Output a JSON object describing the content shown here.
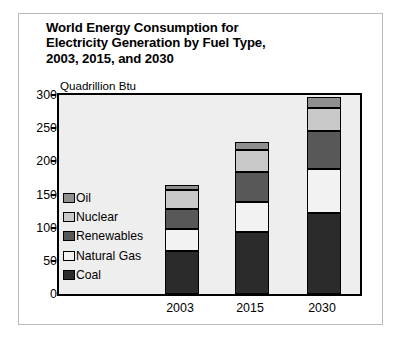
{
  "chart_data": {
    "type": "bar",
    "subtype": "stacked-column",
    "title": "World Energy Consumption for Electricity Generation by Fuel Type, 2003, 2015, and 2030",
    "title_lines": [
      "World Energy Consumption for",
      "Electricity Generation by Fuel Type,",
      "2003, 2015, and 2030"
    ],
    "xlabel": "",
    "ylabel": "Quadrillion Btu",
    "unit_label": "Quadrillion Btu",
    "categories": [
      "2003",
      "2015",
      "2030"
    ],
    "ylim": [
      0,
      300
    ],
    "yticks": [
      0,
      50,
      100,
      150,
      200,
      250,
      300
    ],
    "ytick_labels": [
      "0",
      "50",
      "100",
      "150",
      "200",
      "250",
      "300"
    ],
    "grid": false,
    "legend_position": "inside-left",
    "stack_order_bottom_to_top": [
      "Coal",
      "Natural Gas",
      "Renewables",
      "Nuclear",
      "Oil"
    ],
    "legend_order_top_to_bottom": [
      "Oil",
      "Nuclear",
      "Renewables",
      "Natural Gas",
      "Coal"
    ],
    "series": [
      {
        "name": "Coal",
        "color": "#2b2b2b",
        "values": [
          65,
          93,
          122
        ]
      },
      {
        "name": "Natural Gas",
        "color": "#f2f2f2",
        "values": [
          33,
          45,
          67
        ]
      },
      {
        "name": "Renewables",
        "color": "#585858",
        "values": [
          30,
          46,
          57
        ]
      },
      {
        "name": "Nuclear",
        "color": "#c9c9c9",
        "values": [
          29,
          33,
          35
        ]
      },
      {
        "name": "Oil",
        "color": "#8f8f8f",
        "values": [
          7,
          12,
          16
        ]
      }
    ],
    "totals": [
      164,
      229,
      297
    ],
    "cumulative_tops": {
      "2003": {
        "Coal": 65,
        "Natural Gas": 98,
        "Renewables": 128,
        "Nuclear": 157,
        "Oil": 164
      },
      "2015": {
        "Coal": 93,
        "Natural Gas": 138,
        "Renewables": 184,
        "Nuclear": 217,
        "Oil": 229
      },
      "2030": {
        "Coal": 122,
        "Natural Gas": 189,
        "Renewables": 246,
        "Nuclear": 281,
        "Oil": 297
      }
    },
    "colors": {
      "plot_background": "#eeeeee",
      "figure_background": "#ffffff",
      "axis": "#000000",
      "frame": "#b9b9b9"
    }
  }
}
